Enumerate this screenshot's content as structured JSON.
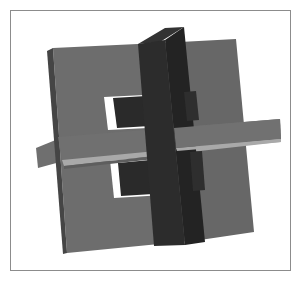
{
  "figure": {
    "colors": {
      "background": "#ffffff",
      "frame": "#8c8c8c",
      "plate_face": "#6d6d6d",
      "plate_side": "#454545",
      "plate_right": "#676767",
      "bar_face": "#6f6f6f",
      "bar_underside": "#a9a9a9",
      "dark_bar_front": "#2c2c2c",
      "dark_bar_side": "#222222",
      "dark_bar_top": "#333333",
      "window": "#ffffff"
    }
  }
}
